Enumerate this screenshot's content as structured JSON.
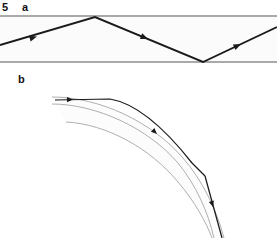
{
  "figure": {
    "number": "5",
    "width": 277,
    "height": 238,
    "background": "#ffffff"
  },
  "panels": [
    {
      "id": "a",
      "label": "a",
      "description": "Ray zig-zagging inside a straight horizontal slab by total internal reflection",
      "geometry_type": "straight-slab"
    },
    {
      "id": "b",
      "label": "b",
      "description": "Ray travelling along a curved (bent) slab and escaping at the outer wall",
      "geometry_type": "curved-slab"
    }
  ],
  "colors": {
    "ray": "#1a1a1a",
    "boundary": "#8e8e8e",
    "boundary_thin": "#9a9a9a",
    "slab_fill": "#fbfbfb",
    "curved_fill": "#fcfcfc",
    "label": "#111111",
    "background": "#ffffff"
  },
  "panel_a": {
    "slab": {
      "top_y": 16,
      "bottom_y": 62,
      "left_x": 0,
      "right_x": 277,
      "stroke_width": 1.4
    },
    "ray_path": {
      "points": [
        {
          "x": 0,
          "y": 45
        },
        {
          "x": 95,
          "y": 17
        },
        {
          "x": 203,
          "y": 62
        },
        {
          "x": 277,
          "y": 27
        }
      ],
      "stroke_width": 1.9
    },
    "arrowheads": [
      {
        "x": 37,
        "y": 36.5,
        "angle": -16.4
      },
      {
        "x": 148,
        "y": 39,
        "angle": 22.6
      },
      {
        "x": 241,
        "y": 44,
        "angle": -25.3
      }
    ]
  },
  "panel_b": {
    "curves": {
      "outer": "M 52,104 C 96,104 148,128 178,163 C 196,185 208,212 214,238",
      "inner": "M 52,97 C 100,97 152,122 183,158 C 202,180 216,208 224,238",
      "far_outer": "M 66,122 C 106,124 150,148 178,182 C 195,202 206,222 212,238",
      "fill": "M 52,97 C 100,97 152,122 183,158 C 202,180 216,208 224,238 L 212,238 C 206,222 195,202 178,182 C 150,148 106,124 66,122 Z",
      "stroke_width": 0.8
    },
    "ray_segments": [
      {
        "name": "incoming-and-guided",
        "path": "M 55,100 L 110,99 C 140,104 170,135 192,163 L 205,176",
        "stroke_width": 1.25
      },
      {
        "name": "escaping",
        "path": "M 205,176 L 222,238",
        "stroke_width": 1.25
      }
    ],
    "arrowheads": [
      {
        "x": 73,
        "y": 99.5,
        "angle": -1.5
      },
      {
        "x": 157,
        "y": 134,
        "angle": 43.0
      },
      {
        "x": 213,
        "y": 207,
        "angle": 74.5
      }
    ]
  }
}
